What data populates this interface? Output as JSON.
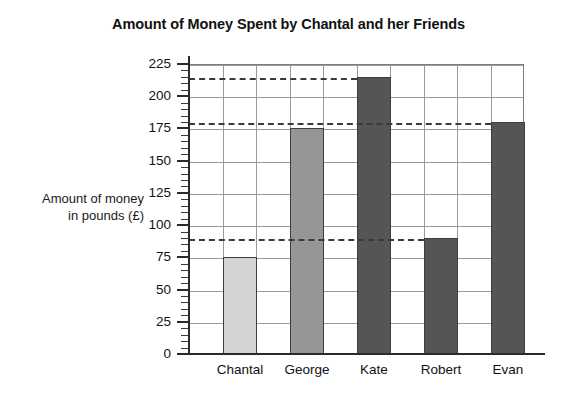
{
  "chart_data": {
    "type": "bar",
    "title": "Amount of Money Spent by Chantal and her Friends",
    "xlabel": "",
    "ylabel": "Amount of money in pounds (£)",
    "ylabel_lines": [
      "Amount of money",
      "in pounds (£)"
    ],
    "categories": [
      "Chantal",
      "George",
      "Kate",
      "Robert",
      "Evan"
    ],
    "values": [
      75,
      175,
      215,
      90,
      180
    ],
    "ylim": [
      0,
      225
    ],
    "ytick_labels": [
      "0",
      "25",
      "50",
      "75",
      "100",
      "125",
      "150",
      "175",
      "200",
      "225"
    ],
    "ytick_values": [
      0,
      25,
      50,
      75,
      100,
      125,
      150,
      175,
      200,
      225
    ],
    "minor_tick_step": 5,
    "grid": true,
    "legend": "none",
    "bar_colors": [
      "#d4d4d4",
      "#969696",
      "#555555",
      "#555555",
      "#555555"
    ],
    "guide_lines": [
      215,
      180,
      90
    ],
    "bar_edge_color": "#3d3d3d",
    "grid_color": "#9a9a9a",
    "axis_color": "#2b2b2b"
  }
}
